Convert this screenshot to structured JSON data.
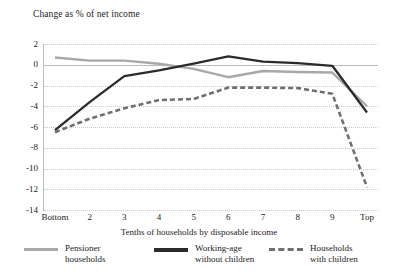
{
  "chart_data": {
    "type": "line",
    "title": "Change as % of net income",
    "xlabel": "Tenths of households by disposable income",
    "ylabel": "",
    "categories": [
      "Bottom",
      "2",
      "3",
      "4",
      "5",
      "6",
      "7",
      "8",
      "9",
      "Top"
    ],
    "yticks": [
      2,
      0,
      -2,
      -4,
      -6,
      -8,
      -10,
      -12,
      -14
    ],
    "ylim": [
      -14,
      2
    ],
    "grid": "horizontal-dotted",
    "legend_position": "bottom",
    "series": [
      {
        "name": "Pensioner households",
        "style": "solid",
        "color": "#a8a8a8",
        "values": [
          0.7,
          0.4,
          0.4,
          0.1,
          -0.4,
          -1.2,
          -0.6,
          -0.7,
          -0.75,
          -4.0
        ]
      },
      {
        "name": "Working-age without children",
        "style": "solid",
        "color": "#2b2b2b",
        "values": [
          -6.3,
          -3.6,
          -1.1,
          -0.55,
          0.1,
          0.8,
          0.3,
          0.15,
          -0.1,
          -4.6
        ]
      },
      {
        "name": "Households with children",
        "style": "dashed",
        "color": "#6f6f6f",
        "values": [
          -6.5,
          -5.2,
          -4.2,
          -3.4,
          -3.3,
          -2.2,
          -2.2,
          -2.25,
          -2.8,
          -11.8
        ]
      }
    ]
  },
  "legend": {
    "items": [
      {
        "label": "Pensioner\nhouseholds",
        "icon": "line-solid-grey-icon"
      },
      {
        "label": "Working-age\nwithout children",
        "icon": "line-solid-black-icon"
      },
      {
        "label": "Households\nwith children",
        "icon": "line-dashed-grey-icon"
      }
    ]
  }
}
